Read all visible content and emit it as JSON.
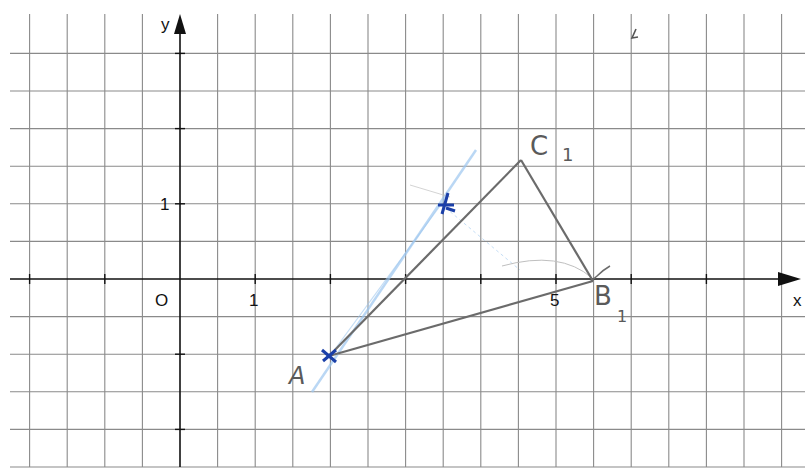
{
  "header_text_partial": "…g…",
  "diagram": {
    "type": "coordinate-grid",
    "axes": {
      "x_label": "x",
      "y_label": "y",
      "origin_label": "O",
      "x_tick_labels": [
        {
          "value": 1,
          "label": "1"
        },
        {
          "value": 5,
          "label": "5"
        }
      ],
      "y_tick_labels": [
        {
          "value": 1,
          "label": "1"
        }
      ],
      "grid_step": 0.5
    },
    "points": [
      {
        "name": "A",
        "label": "A",
        "x": 2,
        "y": -1
      },
      {
        "name": "B1",
        "label": "B",
        "subscript": "1",
        "x": 5.5,
        "y": 0
      },
      {
        "name": "C1",
        "label": "C",
        "subscript": "1",
        "x": 4.5,
        "y": 1.6
      },
      {
        "name": "marked-point",
        "label": "",
        "x": 3.5,
        "y": 1
      }
    ],
    "segments": [
      {
        "from": "A",
        "to": "C1"
      },
      {
        "from": "C1",
        "to": "B1"
      },
      {
        "from": "A",
        "to": "B1"
      }
    ],
    "colors": {
      "grid": "#8a8a8a",
      "axis": "#111111",
      "pencil": "#6b6b6b",
      "ink_blue": "#1a3fa8",
      "light_blue": "#9cc6ef"
    }
  }
}
